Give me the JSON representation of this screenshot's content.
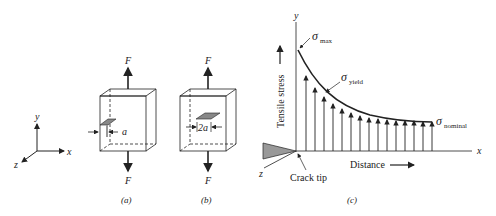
{
  "axes_small": {
    "x": "x",
    "y": "y",
    "z": "z"
  },
  "panel_a": {
    "force_top": "F",
    "force_bottom": "F",
    "crack_label": "a",
    "caption": "(a)"
  },
  "panel_b": {
    "force_top": "F",
    "force_bottom": "F",
    "crack_label": "2a",
    "caption": "(b)"
  },
  "panel_c": {
    "y_axis": "y",
    "x_axis": "x",
    "z_axis": "z",
    "ylabel": "Tensile stress",
    "xlabel": "Distance",
    "sigma": "σ",
    "max_sub": "max",
    "yield_sub": "yield",
    "nominal_sub": "nominal",
    "crack_tip": "Crack tip",
    "caption": "(c)"
  },
  "colors": {
    "line": "#222222",
    "fill": "#888888"
  }
}
